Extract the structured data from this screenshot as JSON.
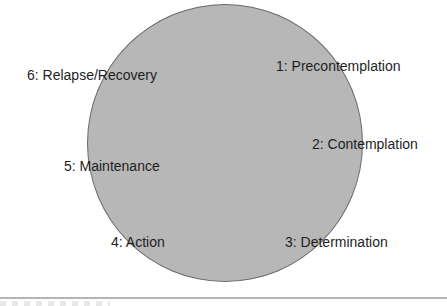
{
  "diagram": {
    "type": "cycle",
    "shape": "circle",
    "fill_color": "#b7b7b7",
    "stages": [
      {
        "label": "1: Precontemplation"
      },
      {
        "label": "2: Contemplation"
      },
      {
        "label": "3: Determination"
      },
      {
        "label": "4: Action"
      },
      {
        "label": "5: Maintenance"
      },
      {
        "label": "6: Relapse/Recovery"
      }
    ]
  }
}
